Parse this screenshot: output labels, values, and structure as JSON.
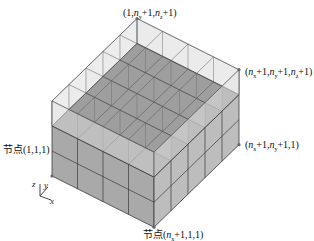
{
  "diagram": {
    "type": "3d-grid-mesh",
    "grid": {
      "nx": 4,
      "ny": 5,
      "nz": 3,
      "solid_layers": 2,
      "transparent_top_layer": true
    },
    "colors": {
      "solid_face": "#a9a9a9",
      "solid_face_side": "#bdbdbd",
      "transparent_face": "#e6e6e6",
      "edge": "#3a3a3a",
      "top_slab": "#8f8f8f"
    },
    "labels": {
      "top_back": {
        "prefix": "",
        "text": "(1,n_y+1,n_z+1)"
      },
      "top_right": {
        "prefix": "",
        "text": "(n_x+1,n_y+1,n_z+1)"
      },
      "mid_right": {
        "prefix": "",
        "text": "(n_x+1,n_y+1,1)"
      },
      "origin": {
        "prefix": "节点",
        "text": "(1,1,1)"
      },
      "front_bottom": {
        "prefix": "节点",
        "text": "(n_x+1,1,1)"
      }
    },
    "axes": {
      "x": "x",
      "y": "y",
      "z": "z"
    }
  }
}
